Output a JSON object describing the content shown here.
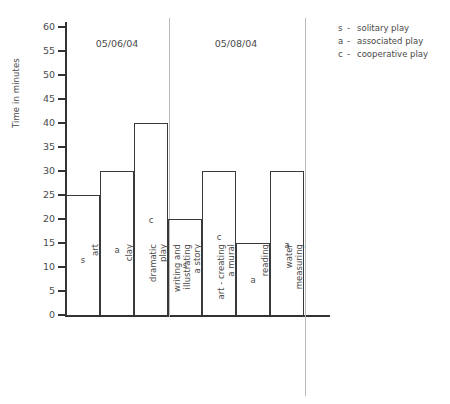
{
  "chart_data": {
    "type": "bar",
    "title": "",
    "xlabel": "",
    "ylabel": "Time in minutes",
    "ylim": [
      0,
      60
    ],
    "ytick_step": 5,
    "yticks": [
      "60",
      "55",
      "50",
      "45",
      "40",
      "35",
      "30",
      "25",
      "20",
      "15",
      "10",
      "5",
      "0"
    ],
    "grid": false,
    "legend_position": "top-right",
    "categories": [
      "art",
      "clay",
      "dramatic play",
      "writing and illustrating a story",
      "art - creating a mural",
      "reading",
      "water measuring"
    ],
    "values": [
      25,
      30,
      40,
      20,
      30,
      15,
      30
    ],
    "point_labels": [
      "s",
      "a",
      "c",
      "s",
      "c",
      "a",
      "a"
    ],
    "groups": [
      {
        "label": "05/06/04",
        "categories": [
          "art",
          "clay",
          "dramatic play"
        ]
      },
      {
        "label": "05/08/04",
        "categories": [
          "writing and illustrating a story",
          "art - creating a mural",
          "reading",
          "water measuring"
        ]
      }
    ],
    "legend": [
      {
        "key": "s",
        "dash": "-",
        "label": "solitary play"
      },
      {
        "key": "a",
        "dash": "-",
        "label": "associated play"
      },
      {
        "key": "c",
        "dash": "-",
        "label": "cooperative play"
      }
    ],
    "colors": {
      "bar_outline": "#3a3a3a",
      "axis": "#333333",
      "text": "#4a4a4a",
      "separator": "#b9b9b9",
      "background": "#ffffff"
    }
  },
  "cat_label_lines": [
    [
      "art"
    ],
    [
      "clay"
    ],
    [
      "dramatic",
      "play"
    ],
    [
      "writing and",
      "illustrating",
      "a story"
    ],
    [
      "art - creating",
      "a mural"
    ],
    [
      "reading"
    ],
    [
      "water",
      "measuring"
    ]
  ]
}
